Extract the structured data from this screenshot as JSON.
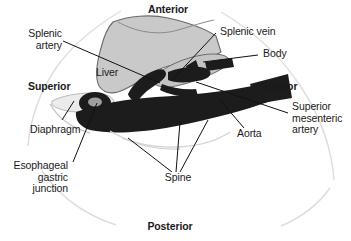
{
  "figure": {
    "orientation_labels": [
      {
        "name": "anterior",
        "text": "Anterior",
        "bold": true
      },
      {
        "name": "posterior",
        "text": "Posterior",
        "bold": true
      },
      {
        "name": "superior",
        "text": "Superior",
        "bold": true
      },
      {
        "name": "inferior",
        "text": "Inferior",
        "bold": true
      }
    ],
    "structure_labels": [
      {
        "name": "splenic-artery",
        "text": "Splenic\nartery"
      },
      {
        "name": "splenic-vein",
        "text": "Splenic vein"
      },
      {
        "name": "body",
        "text": "Body"
      },
      {
        "name": "liver",
        "text": "Liver"
      },
      {
        "name": "diaphragm",
        "text": "Diaphragm"
      },
      {
        "name": "esophageal-gastric-junction",
        "text": "Esophageal\ngastric\njunction"
      },
      {
        "name": "spine",
        "text": "Spine"
      },
      {
        "name": "aorta",
        "text": "Aorta"
      },
      {
        "name": "superior-mesenteric-artery",
        "text": "Superior\nmesenteric\nartery"
      }
    ],
    "colors": {
      "background": "#ffffff",
      "text": "#1a1a1a",
      "organ_fill": "#c9c9c9",
      "organ_stroke": "#5a5a5a",
      "vessel_dark": "#1c1c1c",
      "body_outline": "#dcdcdc",
      "leader_line": "#111111"
    }
  },
  "labels": {
    "anterior": "Anterior",
    "posterior": "Posterior",
    "superior": "Superior",
    "inferior": "Inferior",
    "splenic_artery": "Splenic\nartery",
    "splenic_vein": "Splenic vein",
    "body": "Body",
    "liver": "Liver",
    "diaphragm": "Diaphragm",
    "esophageal_gastric_junction": "Esophageal\ngastric\njunction",
    "spine": "Spine",
    "aorta": "Aorta",
    "superior_mesenteric_artery": "Superior\nmesenteric\nartery"
  }
}
